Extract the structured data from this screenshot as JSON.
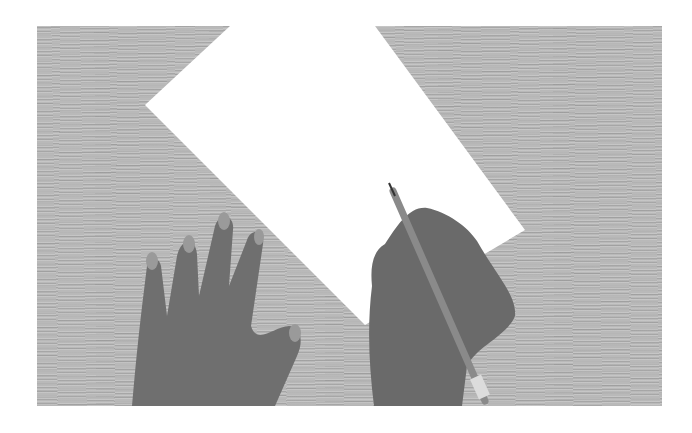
{
  "image": {
    "description": "Grayscale photo of two hands on a wooden desk, one holding a pencil over a white sheet of paper placed diagonally",
    "subjects": [
      "wooden-desk",
      "paper-sheet",
      "left-hand",
      "right-hand",
      "pencil"
    ],
    "colors": {
      "background": "#ffffff",
      "desk": "#b9b9b9",
      "paper": "#ffffff",
      "skin": "#6e6e6e",
      "pencil": "#8a8a8a"
    }
  }
}
